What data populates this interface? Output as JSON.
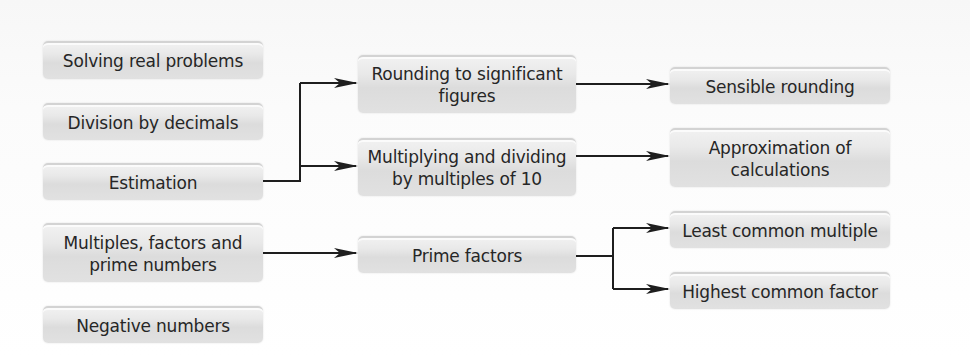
{
  "diagram": {
    "left_column": [
      {
        "id": "solving",
        "label": "Solving real problems"
      },
      {
        "id": "division",
        "label": "Division by decimals"
      },
      {
        "id": "estimation",
        "label": "Estimation"
      },
      {
        "id": "multiples",
        "label": "Multiples, factors and prime numbers"
      },
      {
        "id": "negative",
        "label": "Negative numbers"
      }
    ],
    "middle_column": [
      {
        "id": "rounding_sf",
        "label": "Rounding to significant figures"
      },
      {
        "id": "mult_div_10",
        "label": "Multiplying and dividing by multiples of 10"
      },
      {
        "id": "prime_factors",
        "label": "Prime factors"
      }
    ],
    "right_column": [
      {
        "id": "sensible_rounding",
        "label": "Sensible rounding"
      },
      {
        "id": "approximation",
        "label": "Approximation of calculations"
      },
      {
        "id": "lcm",
        "label": "Least common multiple"
      },
      {
        "id": "hcf",
        "label": "Highest common factor"
      }
    ],
    "edges": [
      {
        "from": "Estimation",
        "to": "Rounding to significant figures"
      },
      {
        "from": "Estimation",
        "to": "Multiplying and dividing by multiples of 10"
      },
      {
        "from": "Rounding to significant figures",
        "to": "Sensible rounding"
      },
      {
        "from": "Multiplying and dividing by multiples of 10",
        "to": "Approximation of calculations"
      },
      {
        "from": "Multiples, factors and prime numbers",
        "to": "Prime factors"
      },
      {
        "from": "Prime factors",
        "to": "Least common multiple"
      },
      {
        "from": "Prime factors",
        "to": "Highest common factor"
      }
    ]
  }
}
